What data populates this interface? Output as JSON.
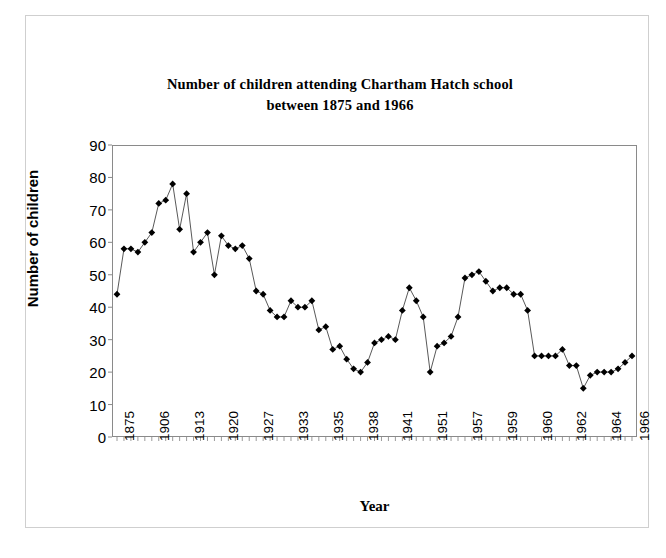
{
  "chart_data": {
    "type": "line",
    "title": "Number of children attending Chartham Hatch school between 1875 and 1966",
    "title_line1": "Number of children attending Chartham Hatch school",
    "title_line2": "between 1875 and 1966",
    "xlabel": "Year",
    "ylabel": "Number of children",
    "ylim": [
      0,
      90
    ],
    "ytick_step": 10,
    "yticks": [
      90,
      80,
      70,
      60,
      50,
      40,
      30,
      20,
      10,
      0
    ],
    "grid": false,
    "legend": false,
    "marker": "diamond",
    "marker_color": "#000000",
    "line_color": "#595959",
    "xtick_labels": [
      "1875",
      "1906",
      "1913",
      "1920",
      "1927",
      "1933",
      "1935",
      "1938",
      "1941",
      "1951",
      "1957",
      "1959",
      "1960",
      "1962",
      "1964",
      "1966"
    ],
    "xtick_indices": [
      0,
      5,
      10,
      15,
      20,
      25,
      30,
      35,
      40,
      45,
      50,
      55,
      60,
      65,
      70,
      74
    ],
    "categories": [
      "1875",
      "1890",
      "1892",
      "1894",
      "1896",
      "1906",
      "1907",
      "1908",
      "1909",
      "1910",
      "1913",
      "1914",
      "1915",
      "1916",
      "1917",
      "1920",
      "1921",
      "1922",
      "1923",
      "1924",
      "1927",
      "1928",
      "1929",
      "1930",
      "1931",
      "1933",
      "1934",
      "1934b",
      "1935",
      "1935b",
      "1935c",
      "1936",
      "1936b",
      "1937",
      "1937b",
      "1938",
      "1938b",
      "1939",
      "1939b",
      "1940",
      "1941",
      "1941b",
      "1942",
      "1943",
      "1944",
      "1951",
      "1952",
      "1953",
      "1954",
      "1955",
      "1957",
      "1957b",
      "1958",
      "1958b",
      "1958c",
      "1959",
      "1959b",
      "1959c",
      "1959d",
      "1959e",
      "1960",
      "1960b",
      "1960c",
      "1961",
      "1961b",
      "1962",
      "1962b",
      "1963",
      "1963b",
      "1964",
      "1964b",
      "1965",
      "1965b",
      "1966a",
      "1966"
    ],
    "values": [
      44,
      58,
      58,
      57,
      60,
      63,
      72,
      73,
      78,
      64,
      75,
      57,
      60,
      63,
      50,
      62,
      59,
      58,
      59,
      55,
      45,
      44,
      39,
      37,
      37,
      42,
      40,
      40,
      42,
      33,
      34,
      27,
      28,
      24,
      21,
      20,
      23,
      29,
      30,
      31,
      30,
      39,
      46,
      42,
      37,
      20,
      28,
      29,
      31,
      37,
      49,
      50,
      51,
      48,
      45,
      46,
      46,
      44,
      44,
      39,
      25,
      25,
      25,
      25,
      27,
      22,
      22,
      15,
      19,
      20,
      20,
      20,
      21,
      23,
      25
    ]
  }
}
